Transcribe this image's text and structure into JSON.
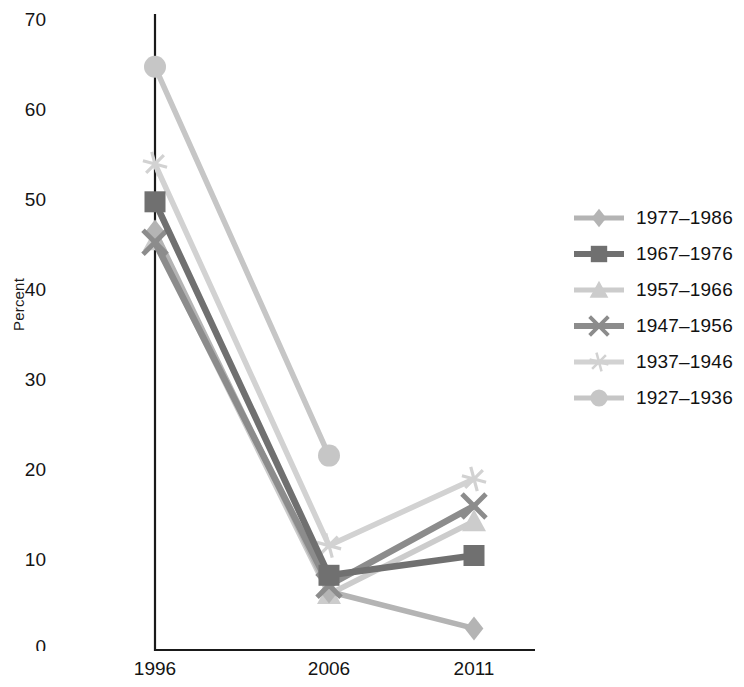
{
  "chart_data": {
    "type": "line",
    "title": "",
    "xlabel": "",
    "ylabel": "Percent",
    "categories": [
      "1996",
      "2006",
      "2011"
    ],
    "x_tick_labels": [
      "1996",
      "2006",
      "2011"
    ],
    "y_tick_labels": [
      "0",
      "10",
      "20",
      "30",
      "40",
      "50",
      "60",
      "70"
    ],
    "y_ticks": [
      0,
      10,
      20,
      30,
      40,
      50,
      60,
      70
    ],
    "ylim": [
      0,
      70
    ],
    "grid": false,
    "legend_position": "right",
    "series": [
      {
        "name": "1977–1986",
        "marker": "diamond",
        "color": "#b4b4b4",
        "values": [
          46.5,
          6.5,
          2.4
        ]
      },
      {
        "name": "1967–1976",
        "marker": "square",
        "color": "#707070",
        "values": [
          49.8,
          8.3,
          10.5
        ]
      },
      {
        "name": "1957–1966",
        "marker": "triangle",
        "color": "#cccccc",
        "values": [
          45.5,
          6.2,
          14.3
        ]
      },
      {
        "name": "1947–1956",
        "marker": "x",
        "color": "#8c8c8c",
        "values": [
          45.3,
          7.2,
          16.0
        ]
      },
      {
        "name": "1937–1946",
        "marker": "asterisk",
        "color": "#d2d2d2",
        "values": [
          54.0,
          11.6,
          19.0
        ]
      },
      {
        "name": "1927–1936",
        "marker": "circle",
        "color": "#c6c6c6",
        "values": [
          64.8,
          21.6,
          null
        ]
      }
    ]
  },
  "legend": {
    "items": [
      {
        "label": "1977–1986",
        "marker": "diamond",
        "color": "#b4b4b4"
      },
      {
        "label": "1967–1976",
        "marker": "square",
        "color": "#707070"
      },
      {
        "label": "1957–1966",
        "marker": "triangle",
        "color": "#cccccc"
      },
      {
        "label": "1947–1956",
        "marker": "x",
        "color": "#8c8c8c"
      },
      {
        "label": "1937–1946",
        "marker": "asterisk",
        "color": "#d2d2d2"
      },
      {
        "label": "1927–1936",
        "marker": "circle",
        "color": "#c6c6c6"
      }
    ]
  },
  "axes": {
    "y_title": "Percent",
    "axis_color": "#1a1a1a"
  }
}
